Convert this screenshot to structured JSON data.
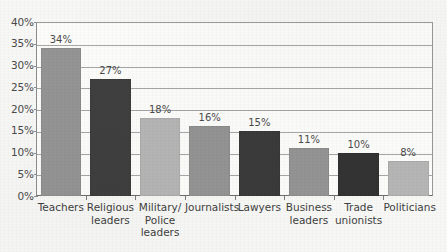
{
  "chart_data": {
    "type": "bar",
    "title": "",
    "subtitle": "",
    "xlabel": "",
    "ylabel": "",
    "ylim": [
      0,
      40
    ],
    "ytick_step": 5,
    "grid": true,
    "legend": false,
    "legend_position": "none",
    "value_suffix": "%",
    "categories": [
      "Teachers",
      "Religious leaders",
      "Military/ Police leaders",
      "Journalists",
      "Lawyers",
      "Business leaders",
      "Trade unionists",
      "Politicians"
    ],
    "values": [
      34,
      27,
      18,
      16,
      15,
      11,
      10,
      8
    ],
    "value_labels": [
      "34%",
      "27%",
      "18%",
      "16%",
      "15%",
      "11%",
      "10%",
      "8%"
    ],
    "bar_colors": [
      "#949494",
      "#3f3f3f",
      "#b5b5b5",
      "#949494",
      "#3a3a3a",
      "#949494",
      "#333333",
      "#b5b5b5"
    ],
    "ytick_labels": [
      "40%",
      "35%",
      "30%",
      "25%",
      "20%",
      "15%",
      "10%",
      "5%",
      "0%"
    ],
    "ytick_values": [
      40,
      35,
      30,
      25,
      20,
      15,
      10,
      5,
      0
    ],
    "axis_color": "#8d8d8d",
    "gridline_color": "#a6a6a6",
    "plot_background": "#fcfcfb",
    "page_background": "#f7f7f5",
    "text_color": "#3f3f3f"
  }
}
